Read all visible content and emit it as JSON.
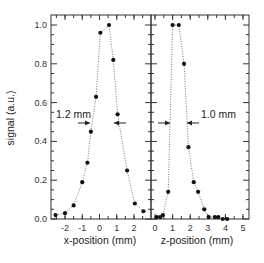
{
  "chart_data": [
    {
      "type": "scatter",
      "panel": "left",
      "title": "",
      "xlabel": "x-position (mm)",
      "ylabel": "signal (a.u.)",
      "xlim": [
        -2.8,
        3.0
      ],
      "ylim": [
        0.0,
        1.05
      ],
      "xticks": [
        -2,
        -1,
        0,
        1,
        2
      ],
      "yticks": [
        0.0,
        0.2,
        0.4,
        0.6,
        0.8,
        1.0
      ],
      "grid": false,
      "line_style": "dotted",
      "series": [
        {
          "name": "x profile",
          "x": [
            -2.55,
            -2.0,
            -1.5,
            -1.0,
            -0.7,
            -0.5,
            -0.2,
            0.05,
            0.55,
            0.8,
            1.05,
            1.6,
            2.05,
            2.55
          ],
          "y": [
            0.02,
            0.03,
            0.07,
            0.19,
            0.29,
            0.45,
            0.63,
            0.96,
            1.0,
            0.82,
            0.54,
            0.25,
            0.08,
            0.04
          ]
        }
      ],
      "annotations": [
        {
          "text": "1.2 mm",
          "type": "FWHM arrows",
          "y": 0.5
        }
      ]
    },
    {
      "type": "scatter",
      "panel": "right",
      "title": "",
      "xlabel": "z-position (mm)",
      "ylabel": "",
      "xlim": [
        -0.2,
        5.3
      ],
      "ylim": [
        0.0,
        1.05
      ],
      "xticks": [
        0,
        1,
        2,
        3,
        4,
        5
      ],
      "yticks": [
        0.0,
        0.2,
        0.4,
        0.6,
        0.8,
        1.0
      ],
      "grid": false,
      "line_style": "dotted",
      "series": [
        {
          "name": "z profile",
          "x": [
            0.1,
            0.3,
            0.45,
            0.75,
            1.0,
            1.35,
            1.65,
            1.9,
            2.2,
            2.45,
            2.8,
            3.05,
            3.4,
            3.6,
            3.85,
            4.1
          ],
          "y": [
            0.01,
            0.01,
            0.02,
            0.14,
            1.0,
            1.0,
            0.8,
            0.37,
            0.19,
            0.14,
            0.05,
            0.01,
            0.01,
            0.01,
            0.0,
            0.0
          ]
        }
      ],
      "annotations": [
        {
          "text": "1.0 mm",
          "type": "FWHM arrows",
          "y": 0.5
        }
      ]
    }
  ],
  "labels": {
    "ylabel": "signal (a.u.)",
    "left_xlabel": "x-position (mm)",
    "right_xlabel": "z-position (mm)",
    "left_annot": "1.2 mm",
    "right_annot": "1.0 mm"
  },
  "colors": {
    "points": "#111111",
    "line": "#555555",
    "axes": "#333333"
  }
}
